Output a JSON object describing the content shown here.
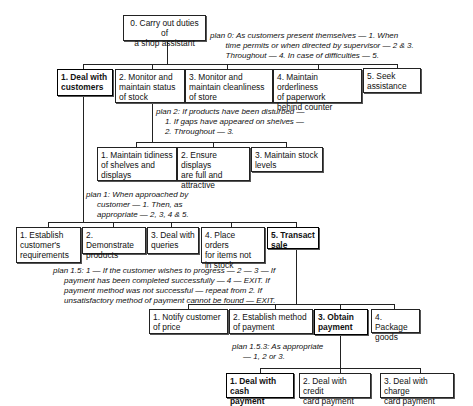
{
  "root": {
    "label": "0. Carry out duties of\na shop assistant"
  },
  "plans": {
    "plan0": "plan 0: As customers present themselves — 1. When\n       time permits or when directed by supervisor — 2 & 3.\n       Throughout — 4. In case of difficulties — 5.",
    "plan2": "plan 2: If products have been disturbed —\n    1. If gaps have appeared on shelves —\n    2. Throughout — 3.",
    "plan1": "plan 1: When approached by\n     customer — 1. Then, as\n     appropriate — 2, 3, 4 & 5.",
    "plan1_5": "plan 1.5: 1 — If the customer wishes to progress — 2 — 3 — If\n     payment has been completed successfully — 4 — EXIT. If\n     payment method was not successful — repeat from 2. If\n     unsatisfactory method of payment cannot be found — EXIT.",
    "plan1_5_3": "plan 1.5.3: As appropriate\n     — 1, 2 or 3."
  },
  "level1": [
    {
      "label": "1. Deal with\n    customers"
    },
    {
      "label": "2. Monitor and\n    maintain status\n    of stock"
    },
    {
      "label": "3. Monitor and\n    maintain cleanliness\n    of store"
    },
    {
      "label": "4. Maintain orderliness\n    of paperwork\n    behind counter"
    },
    {
      "label": "5. Seek\n    assistance"
    }
  ],
  "level2_stock": [
    {
      "label": "1. Maintain tidiness\n    of shelves and\n    displays"
    },
    {
      "label": "2. Ensure displays\n    are full and\n    attractive"
    },
    {
      "label": "3. Maintain stock\n    levels"
    }
  ],
  "level2_customers": [
    {
      "label": "1. Establish\n    customer's\n    requirements"
    },
    {
      "label": "2. Demonstrate\n    products"
    },
    {
      "label": "3. Deal with\n    queries"
    },
    {
      "label": "4. Place orders\n    for items not\n    in stock"
    },
    {
      "label": "5. Transact\n    sale"
    }
  ],
  "level3_sale": [
    {
      "label": "1. Notify customer\n    of price"
    },
    {
      "label": "2. Establish method\n    of payment"
    },
    {
      "label": "3. Obtain\n    payment"
    },
    {
      "label": "4. Package\n    goods"
    }
  ],
  "level4_payment": [
    {
      "label": "1. Deal with cash\n    payment"
    },
    {
      "label": "2. Deal with credit\n    card payment"
    },
    {
      "label": "3. Deal with charge\n    card payment"
    }
  ]
}
